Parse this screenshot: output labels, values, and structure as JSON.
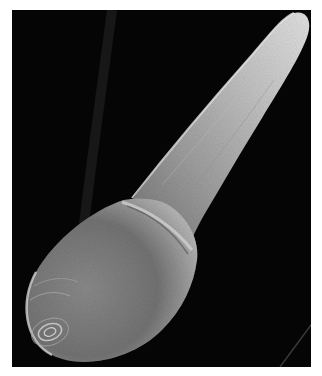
{
  "image": {
    "description": "Scanning electron micrograph of an elongated, club-shaped specimen on a black background",
    "alt": "SEM micrograph of elongated specimen",
    "colors": {
      "background": "#050505",
      "border": "#ffffff",
      "specimen_light": "#d8d8d8",
      "specimen_mid": "#9a9a9a",
      "specimen_dark": "#5a5a5a"
    }
  }
}
